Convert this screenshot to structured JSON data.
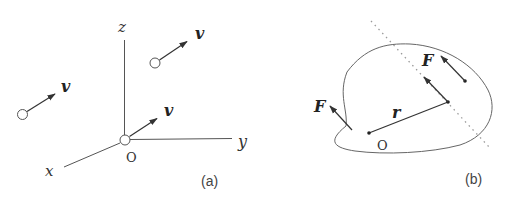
{
  "panel_a": {
    "caption": "(a)",
    "axes": {
      "x": "x",
      "y": "y",
      "z": "z",
      "origin": "O"
    },
    "vector_label": "v",
    "vectors": [
      {
        "label": "v"
      },
      {
        "label": "v"
      },
      {
        "label": "v"
      }
    ]
  },
  "panel_b": {
    "caption": "(b)",
    "origin": "O",
    "position_vector": "r",
    "forces": [
      {
        "label": "F"
      },
      {
        "label": "F"
      }
    ]
  },
  "colors": {
    "stroke": "#444444",
    "line_of_action": "#9a9a9a"
  }
}
